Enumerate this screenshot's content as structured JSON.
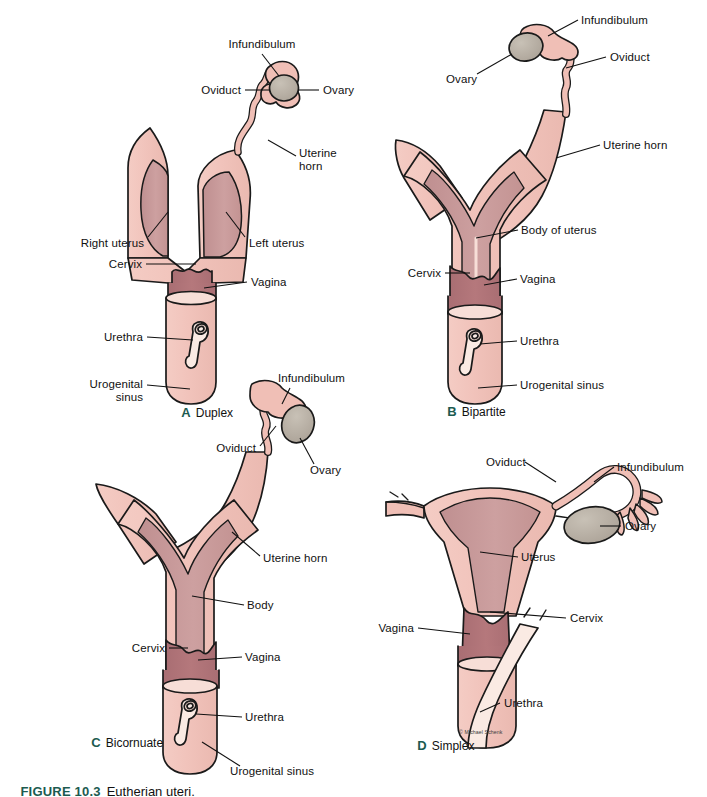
{
  "figure": {
    "number": "FIGURE 10.3",
    "caption": "Eutherian uteri.",
    "credit": "© Michael Schenk",
    "accent_color": "#1c5b50",
    "palette": {
      "outer_tissue": "#f1c3bb",
      "outer_tissue_light": "#f7ded7",
      "lumen_wall": "#c79a99",
      "endometrium": "#cfa0a0",
      "vagina": "#b5787c",
      "ovary": "#b4aca0",
      "outline": "#1a1a1a",
      "background": "#ffffff"
    }
  },
  "panels": [
    {
      "letter": "A",
      "name": "Duplex",
      "caption_x": 168,
      "caption_y": 412,
      "labels": [
        {
          "text": "Infundibulum",
          "x": 262,
          "y": 44,
          "align": "center"
        },
        {
          "text": "Oviduct",
          "x": 241,
          "y": 90,
          "align": "right"
        },
        {
          "text": "Ovary",
          "x": 323,
          "y": 90,
          "align": "left"
        },
        {
          "text": "Uterine\nhorn",
          "x": 299,
          "y": 160,
          "align": "left"
        },
        {
          "text": "Right uterus",
          "x": 144,
          "y": 243,
          "align": "right"
        },
        {
          "text": "Left uterus",
          "x": 249,
          "y": 243,
          "align": "left"
        },
        {
          "text": "Cervix",
          "x": 142,
          "y": 264,
          "align": "right"
        },
        {
          "text": "Vagina",
          "x": 251,
          "y": 282,
          "align": "left"
        },
        {
          "text": "Urethra",
          "x": 143,
          "y": 337,
          "align": "right"
        },
        {
          "text": "Urogenital\nsinus",
          "x": 143,
          "y": 391,
          "align": "right"
        }
      ]
    },
    {
      "letter": "B",
      "name": "Bipartite",
      "caption_x": 434,
      "caption_y": 411,
      "labels": [
        {
          "text": "Infundibulum",
          "x": 581,
          "y": 20,
          "align": "left"
        },
        {
          "text": "Oviduct",
          "x": 610,
          "y": 57,
          "align": "left"
        },
        {
          "text": "Ovary",
          "x": 470,
          "y": 79,
          "align": "left"
        },
        {
          "text": "Uterine horn",
          "x": 603,
          "y": 145,
          "align": "left"
        },
        {
          "text": "Body of uterus",
          "x": 521,
          "y": 230,
          "align": "left"
        },
        {
          "text": "Cervix",
          "x": 412,
          "y": 273,
          "align": "left"
        },
        {
          "text": "Vagina",
          "x": 520,
          "y": 279,
          "align": "left"
        },
        {
          "text": "Urethra",
          "x": 520,
          "y": 341,
          "align": "left"
        },
        {
          "text": "Urogenital sinus",
          "x": 520,
          "y": 385,
          "align": "left"
        }
      ]
    },
    {
      "letter": "C",
      "name": "Bicornuate",
      "caption_x": 78,
      "caption_y": 742,
      "labels": [
        {
          "text": "Infundibulum",
          "x": 278,
          "y": 378,
          "align": "left"
        },
        {
          "text": "Oviduct",
          "x": 256,
          "y": 448,
          "align": "right"
        },
        {
          "text": "Ovary",
          "x": 310,
          "y": 470,
          "align": "left"
        },
        {
          "text": "Uterine horn",
          "x": 263,
          "y": 558,
          "align": "left"
        },
        {
          "text": "Body",
          "x": 247,
          "y": 605,
          "align": "left"
        },
        {
          "text": "Cervix",
          "x": 165,
          "y": 648,
          "align": "right"
        },
        {
          "text": "Vagina",
          "x": 245,
          "y": 657,
          "align": "left"
        },
        {
          "text": "Urethra",
          "x": 245,
          "y": 717,
          "align": "left"
        },
        {
          "text": "Urogenital sinus",
          "x": 230,
          "y": 771,
          "align": "left"
        }
      ]
    },
    {
      "letter": "D",
      "name": "Simplex",
      "caption_x": 404,
      "caption_y": 745,
      "labels": [
        {
          "text": "Oviduct",
          "x": 486,
          "y": 462,
          "align": "left"
        },
        {
          "text": "Infundibulum",
          "x": 617,
          "y": 467,
          "align": "left"
        },
        {
          "text": "Ovary",
          "x": 625,
          "y": 526,
          "align": "left"
        },
        {
          "text": "Uterus",
          "x": 521,
          "y": 557,
          "align": "left"
        },
        {
          "text": "Cervix",
          "x": 540,
          "y": 618,
          "align": "left"
        },
        {
          "text": "Vagina",
          "x": 414,
          "y": 628,
          "align": "right"
        },
        {
          "text": "Urethra",
          "x": 504,
          "y": 703,
          "align": "left"
        }
      ]
    }
  ]
}
